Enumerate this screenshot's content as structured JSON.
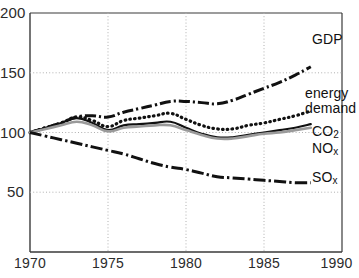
{
  "chart_data": {
    "type": "line",
    "title": "",
    "subtitle": "",
    "xlabel": "",
    "ylabel": "",
    "xlim": [
      1970,
      1990
    ],
    "ylim": [
      0,
      200
    ],
    "grid": true,
    "grid_style": "dotted",
    "legend_position": "right-inline-labels",
    "index_base": "1970 = 100",
    "xticks": [
      "1970",
      "1975",
      "1980",
      "1985",
      "1990"
    ],
    "xtick_values": [
      1970,
      1975,
      1980,
      1985,
      1990
    ],
    "yticks": [
      "50",
      "100",
      "150",
      "200"
    ],
    "ytick_values": [
      50,
      100,
      150,
      200
    ],
    "x": [
      1970,
      1971,
      1972,
      1973,
      1974,
      1975,
      1976,
      1977,
      1978,
      1979,
      1980,
      1981,
      1982,
      1983,
      1984,
      1985,
      1986,
      1987,
      1988
    ],
    "series": [
      {
        "name": "GDP",
        "label": "GDP",
        "line_style": "dash-dot",
        "color": "#111111",
        "values": [
          100,
          104,
          108,
          113,
          114,
          113,
          117,
          120,
          123,
          126,
          126,
          125,
          124,
          127,
          132,
          137,
          142,
          148,
          155
        ]
      },
      {
        "name": "energy demand",
        "label": "energy demand",
        "line_style": "dotted",
        "color": "#111111",
        "values": [
          100,
          104,
          108,
          113,
          110,
          105,
          110,
          112,
          114,
          116,
          111,
          106,
          103,
          103,
          106,
          108,
          111,
          114,
          118
        ]
      },
      {
        "name": "CO2",
        "label": "CO",
        "label_sub": "2",
        "line_style": "solid-thick",
        "color": "#111111",
        "values": [
          100,
          104,
          108,
          112,
          108,
          102,
          106,
          107,
          108,
          109,
          104,
          99,
          96,
          96,
          98,
          100,
          102,
          104,
          107
        ]
      },
      {
        "name": "NOx",
        "label": "NO",
        "label_sub": "x",
        "line_style": "solid-grey",
        "color": "#9a9a9a",
        "values": [
          100,
          103,
          106,
          109,
          106,
          101,
          104,
          105,
          106,
          106,
          102,
          98,
          95,
          95,
          97,
          99,
          100,
          102,
          104
        ]
      },
      {
        "name": "SOx",
        "label": "SO",
        "label_sub": "x",
        "line_style": "long-dash-dot",
        "color": "#111111",
        "values": [
          100,
          97,
          94,
          91,
          88,
          85,
          82,
          78,
          74,
          71,
          69,
          66,
          63,
          62,
          61,
          60,
          59,
          58,
          58
        ]
      }
    ]
  },
  "axis": {
    "y_labels": [
      "200",
      "150",
      "100",
      "50"
    ],
    "x_labels": [
      "1970",
      "1975",
      "1980",
      "1985",
      "1990"
    ]
  },
  "labels": {
    "gdp": "GDP",
    "energy": "energy",
    "demand": "demand",
    "co2_main": "CO",
    "co2_sub": "2",
    "nox_main": "NO",
    "nox_sub": "x",
    "sox_main": "SO",
    "sox_sub": "x"
  },
  "colors": {
    "axis": "#3a3a3a",
    "grid": "#b8b8b8",
    "line_dark": "#111111",
    "line_grey": "#9a9a9a",
    "background": "#ffffff"
  }
}
